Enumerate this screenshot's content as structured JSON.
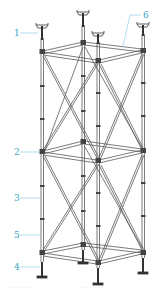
{
  "diagram": {
    "colors": {
      "structure": "#555555",
      "label": "#3aa6c8",
      "leader": "#7cc4dc"
    },
    "labels": [
      {
        "id": "1",
        "text": "1",
        "x": 14,
        "y": 29,
        "target": "top-adjustable-u-head-jack"
      },
      {
        "id": "6",
        "text": "6",
        "x": 143,
        "y": 11,
        "target": "top-horizontal-ledger"
      },
      {
        "id": "2",
        "text": "2",
        "x": 14,
        "y": 148,
        "target": "middle-frame-node"
      },
      {
        "id": "3",
        "text": "3",
        "x": 14,
        "y": 194,
        "target": "vertical-standard"
      },
      {
        "id": "5",
        "text": "5",
        "x": 14,
        "y": 231,
        "target": "diagonal-brace"
      },
      {
        "id": "4",
        "text": "4",
        "x": 14,
        "y": 263,
        "target": "base-jack"
      }
    ],
    "caption": [
      "··· ··· ···",
      "··· ··· ···"
    ]
  }
}
